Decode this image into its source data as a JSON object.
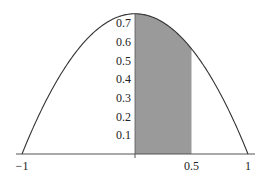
{
  "chart_data": {
    "type": "area",
    "title": "",
    "function": "y = 0.75(1 - x^2)",
    "curve": {
      "x": [
        -1,
        -0.75,
        -0.5,
        -0.25,
        0,
        0.25,
        0.5,
        0.75,
        1
      ],
      "y": [
        0,
        0.328,
        0.5625,
        0.703,
        0.75,
        0.703,
        0.5625,
        0.328,
        0
      ]
    },
    "shaded_region": {
      "x_from": 0,
      "x_to": 0.5,
      "color": "#9a9a9a"
    },
    "xlabel": "",
    "ylabel": "",
    "x_ticks": [
      {
        "value": -1,
        "label": "−1"
      },
      {
        "value": 0.5,
        "label": "0.5"
      },
      {
        "value": 1,
        "label": "1"
      }
    ],
    "y_ticks": [
      {
        "value": 0.1,
        "label": "0.1"
      },
      {
        "value": 0.2,
        "label": "0.2"
      },
      {
        "value": 0.3,
        "label": "0.3"
      },
      {
        "value": 0.4,
        "label": "0.4"
      },
      {
        "value": 0.5,
        "label": "0.5"
      },
      {
        "value": 0.6,
        "label": "0.6"
      },
      {
        "value": 0.7,
        "label": "0.7"
      }
    ],
    "xlim": [
      -1.1,
      1.1
    ],
    "ylim": [
      0,
      0.75
    ],
    "grid": false,
    "legend": null
  }
}
